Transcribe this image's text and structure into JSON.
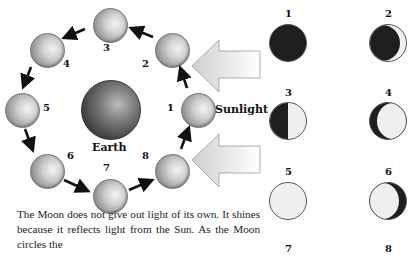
{
  "diagram": {
    "orbit_labels": [
      "1",
      "2",
      "3",
      "4",
      "5",
      "6",
      "7",
      "8"
    ],
    "earth_label": "Earth",
    "sunlight_label": "Sunlight",
    "phase_labels": [
      "1",
      "2",
      "3",
      "4",
      "5",
      "6",
      "7",
      "8"
    ],
    "phase_names": [
      "new moon",
      "waxing crescent",
      "first quarter",
      "waxing gibbous",
      "full moon",
      "waning gibbous",
      "last quarter",
      "waning crescent"
    ],
    "caption": "The Moon does not give out light of its own. It shines because it reflects light from the Sun. As the Moon circles the"
  },
  "colors": {
    "dark_side": "#1e1e1e",
    "lit_side": "#efefef",
    "arrow_fill": "#d9d9d9"
  }
}
